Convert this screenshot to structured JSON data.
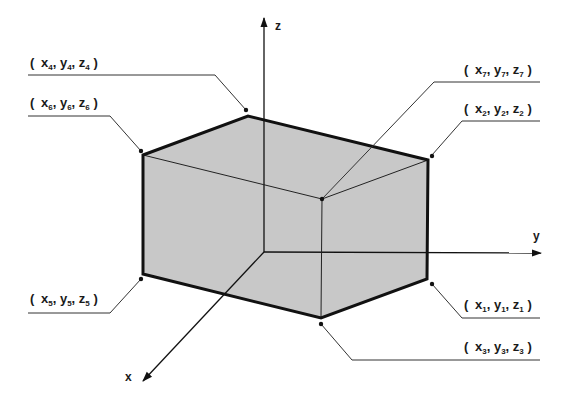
{
  "diagram": {
    "type": "isometric-box-vertex-coordinates",
    "axes": {
      "x": {
        "label": "x"
      },
      "y": {
        "label": "y"
      },
      "z": {
        "label": "z"
      }
    },
    "box": {
      "fill_color": "#c8c8c8",
      "edge_color": "#111111"
    },
    "vertices": [
      {
        "id": 1,
        "label": {
          "open": "(",
          "x": "x",
          "xs": "1",
          "y": "y",
          "ys": "1",
          "z": "z",
          "zs": "1",
          "close": ")"
        },
        "position": "bottom-right"
      },
      {
        "id": 2,
        "label": {
          "open": "(",
          "x": "x",
          "xs": "2",
          "y": "y",
          "ys": "2",
          "z": "z",
          "zs": "2",
          "close": ")"
        },
        "position": "top-right"
      },
      {
        "id": 3,
        "label": {
          "open": "(",
          "x": "x",
          "xs": "3",
          "y": "y",
          "ys": "3",
          "z": "z",
          "zs": "3",
          "close": ")"
        },
        "position": "bottom-front"
      },
      {
        "id": 4,
        "label": {
          "open": "(",
          "x": "x",
          "xs": "4",
          "y": "y",
          "ys": "4",
          "z": "z",
          "zs": "4",
          "close": ")"
        },
        "position": "top-back"
      },
      {
        "id": 5,
        "label": {
          "open": "(",
          "x": "x",
          "xs": "5",
          "y": "y",
          "ys": "5",
          "z": "z",
          "zs": "5",
          "close": ")"
        },
        "position": "bottom-left"
      },
      {
        "id": 6,
        "label": {
          "open": "(",
          "x": "x",
          "xs": "6",
          "y": "y",
          "ys": "6",
          "z": "z",
          "zs": "6",
          "close": ")"
        },
        "position": "top-left"
      },
      {
        "id": 7,
        "label": {
          "open": "(",
          "x": "x",
          "xs": "7",
          "y": "y",
          "ys": "7",
          "z": "z",
          "zs": "7",
          "close": ")"
        },
        "position": "top-front"
      }
    ]
  }
}
